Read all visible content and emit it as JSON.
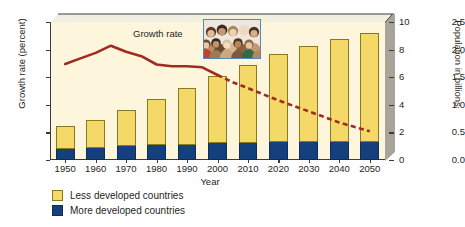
{
  "chart_data": {
    "type": "bar",
    "title": "",
    "xlabel": "Year",
    "ylabel": "Growth rate (percent)",
    "ylabel_right": "Population in billions",
    "categories": [
      "1950",
      "1960",
      "1970",
      "1980",
      "1990",
      "2000",
      "2010",
      "2020",
      "2030",
      "2040",
      "2050"
    ],
    "ylim": [
      0,
      2.5
    ],
    "ylim_right": [
      0,
      10
    ],
    "yticks": [
      "0.0",
      "0.5",
      "1.0",
      "1.5",
      "2.0",
      "2.5"
    ],
    "yticks_right": [
      "0",
      "2",
      "4",
      "6",
      "8",
      "10"
    ],
    "grid": false,
    "legend_position": "bottom-left",
    "series": [
      {
        "name": "Less developed countries",
        "type": "bar",
        "axis": "right",
        "color": "#f4d968",
        "values": [
          1.7,
          2.0,
          2.6,
          3.3,
          4.1,
          4.9,
          5.7,
          6.4,
          7.0,
          7.5,
          7.9
        ]
      },
      {
        "name": "More developed countries",
        "type": "bar",
        "axis": "right",
        "color": "#14417d",
        "values": [
          0.8,
          0.9,
          1.0,
          1.1,
          1.1,
          1.2,
          1.2,
          1.3,
          1.3,
          1.3,
          1.3
        ]
      },
      {
        "name": "Growth rate",
        "type": "line",
        "axis": "left",
        "color": "#a02c1e",
        "x": [
          "1950",
          "1955",
          "1960",
          "1965",
          "1970",
          "1975",
          "1980",
          "1985",
          "1990",
          "1995",
          "2000",
          "2005",
          "2010",
          "2020",
          "2030",
          "2040",
          "2050"
        ],
        "values": [
          1.74,
          1.84,
          1.94,
          2.07,
          1.96,
          1.88,
          1.73,
          1.7,
          1.7,
          1.68,
          1.54,
          1.41,
          1.3,
          1.08,
          0.88,
          0.68,
          0.52
        ],
        "solid_until": "2000",
        "dashed_from": "2000"
      }
    ],
    "annotations": [
      {
        "name": "growth-rate-label",
        "text": "Growth rate"
      }
    ],
    "legend": [
      {
        "label": "Less developed countries",
        "color": "#f4d968"
      },
      {
        "label": "More developed countries",
        "color": "#14417d"
      }
    ],
    "inset": {
      "name": "crowd-photo",
      "caption": ""
    }
  }
}
